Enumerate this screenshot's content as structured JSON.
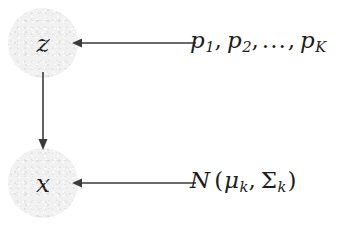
{
  "diagram": {
    "type": "probabilistic-graphical-model",
    "background_color": "#ffffff",
    "node_fill_color": "#f1f1f1",
    "stroke_color": "#3a3a3a",
    "text_color": "#1d1d1d",
    "nodes": [
      {
        "id": "z",
        "label": "z",
        "cx": 43,
        "cy": 43,
        "r": 35
      },
      {
        "id": "x",
        "label": "x",
        "cx": 43,
        "cy": 183,
        "r": 35
      }
    ],
    "edges": [
      {
        "id": "p-to-z",
        "from": "mixing-weights",
        "to": "z",
        "direction": "left",
        "orientation": "horizontal"
      },
      {
        "id": "z-to-x",
        "from": "z",
        "to": "x",
        "direction": "down",
        "orientation": "vertical"
      },
      {
        "id": "n-to-x",
        "from": "gaussian",
        "to": "x",
        "direction": "left",
        "orientation": "horizontal"
      }
    ],
    "labels": {
      "mixing_weights": {
        "plain_text": "p_1, p_2, ..., p_K",
        "symbol": "p",
        "sub1": "1",
        "sub2": "2",
        "ellipsis": "...",
        "subK": "K",
        "comma": ","
      },
      "gaussian": {
        "plain_text": "N(μ_k, Σ_k)",
        "distribution": "N",
        "open_paren": "(",
        "mean_symbol": "μ",
        "mean_sub": "k",
        "comma": ",",
        "cov_symbol": "Σ",
        "cov_sub": "k",
        "close_paren": ")"
      }
    },
    "node_labels": {
      "z": "z",
      "x": "x"
    }
  }
}
